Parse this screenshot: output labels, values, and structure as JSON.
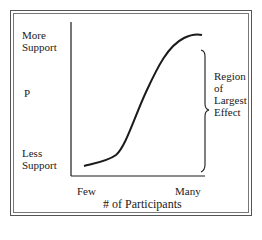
{
  "diagram": {
    "y_axis": {
      "top_label": "More Support",
      "middle_label": "P",
      "bottom_label": "Less Support"
    },
    "x_axis": {
      "left_label": "Few",
      "right_label": "Many",
      "title": "# of Participants"
    },
    "curve": {
      "shape": "sigmoid",
      "description": "S-shaped curve rising from low support at few participants to high support at many participants"
    },
    "annotation": {
      "label": "Region of Largest Effect",
      "lines": [
        "Region",
        "of",
        "Largest",
        "Effect"
      ],
      "marker": "right-curly-brace"
    },
    "colors": {
      "ink": "#1a1a1a",
      "frame": "#555555",
      "background": "#ffffff"
    }
  }
}
